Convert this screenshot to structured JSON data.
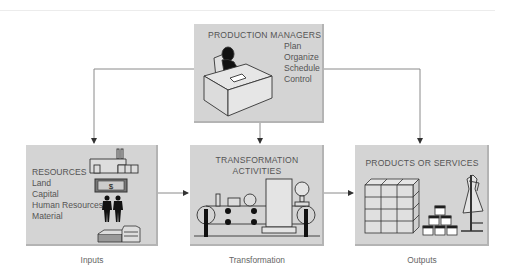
{
  "diagram": {
    "type": "production-system-flow",
    "managers": {
      "title": "PRODUCTION MANAGERS",
      "functions": [
        "Plan",
        "Organize",
        "Schedule",
        "Control"
      ],
      "icon": "manager-at-desk-icon"
    },
    "inputs": {
      "title": "RESOURCES",
      "items": [
        "Land",
        "Capital",
        "Human Resources",
        "Material"
      ],
      "icons": [
        "factory-icon",
        "dollar-bill-icon",
        "people-icon",
        "material-stack-icon"
      ],
      "caption": "Inputs"
    },
    "transformation": {
      "title_line1": "TRANSFORMATION",
      "title_line2": "ACTIVITIES",
      "icon": "machinery-icon",
      "caption": "Transformation"
    },
    "outputs": {
      "title": "PRODUCTS OR SERVICES",
      "icons": [
        "boxes-icon",
        "cans-pyramid-icon",
        "dress-form-icon"
      ],
      "caption": "Outputs"
    },
    "edges": [
      {
        "from": "managers",
        "to": "inputs"
      },
      {
        "from": "managers",
        "to": "transformation"
      },
      {
        "from": "managers",
        "to": "outputs"
      },
      {
        "from": "inputs",
        "to": "transformation"
      },
      {
        "from": "transformation",
        "to": "outputs"
      }
    ],
    "colors": {
      "box_fill": "#d4d4d4",
      "box_shadow": "#b4b4b4",
      "line": "#777777",
      "text": "#555555"
    }
  }
}
